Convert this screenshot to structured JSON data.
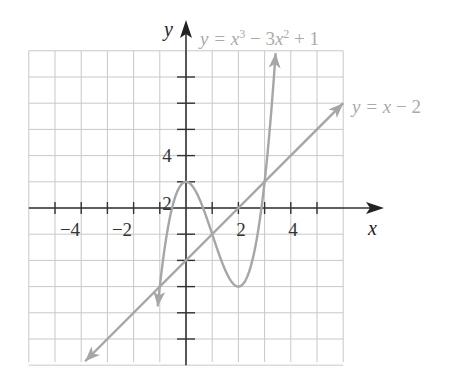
{
  "chart_data": {
    "type": "line",
    "title": "",
    "xlabel": "x",
    "ylabel": "y",
    "xlim": [
      -6,
      6
    ],
    "ylim": [
      -6,
      6
    ],
    "grid": true,
    "x_tick_labels": [
      "-4",
      "-2",
      "2",
      "4"
    ],
    "y_tick_labels": [
      "4",
      "2"
    ],
    "series": [
      {
        "name": "y = x^3 - 3x^2 + 1",
        "label": "y = x³ − 3x² + 1",
        "equation": "x^3 - 3x^2 + 1",
        "points": [
          [
            -1.1,
            -5.96
          ],
          [
            -1,
            -3
          ],
          [
            -0.5,
            0.125
          ],
          [
            0,
            1
          ],
          [
            0.5,
            0.375
          ],
          [
            1,
            -1
          ],
          [
            1.5,
            -2.375
          ],
          [
            2,
            -3
          ],
          [
            2.5,
            -2.125
          ],
          [
            3,
            1
          ],
          [
            3.3,
            4.267
          ],
          [
            3.45,
            5.35
          ]
        ],
        "color": "#a6a6a6"
      },
      {
        "name": "y = x - 2",
        "label": "y = x − 2",
        "equation": "x - 2",
        "points": [
          [
            -3.8,
            -5.8
          ],
          [
            6,
            4
          ]
        ],
        "color": "#a6a6a6"
      }
    ],
    "intersections": [
      [
        -1,
        -3
      ],
      [
        1,
        -1
      ],
      [
        3,
        1
      ]
    ]
  },
  "labels": {
    "axis_x": "x",
    "axis_y": "y",
    "curve_label": "y = x³ − 3x² + 1",
    "line_label": "y = x − 2",
    "xticks": [
      "−4",
      "−2",
      "2",
      "4"
    ],
    "yticks": [
      "4",
      "2"
    ]
  }
}
